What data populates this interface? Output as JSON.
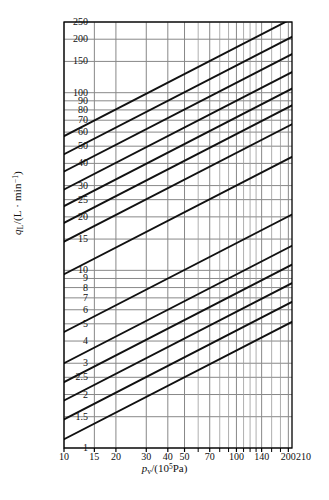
{
  "chart_data": {
    "type": "line",
    "title": "",
    "subtitle": "",
    "xlabel": "p_v/(10^5 Pa)",
    "ylabel": "q_L/(L · min^-1)",
    "xscale": "log",
    "yscale": "log",
    "xlim": [
      10,
      210
    ],
    "ylim": [
      1,
      250
    ],
    "grid": true,
    "legend": false,
    "x_ticks": [
      {
        "value": 10,
        "label": "10"
      },
      {
        "value": 15,
        "label": "15"
      },
      {
        "value": 20,
        "label": "20"
      },
      {
        "value": 30,
        "label": "30"
      },
      {
        "value": 40,
        "label": "40"
      },
      {
        "value": 50,
        "label": "50"
      },
      {
        "value": 70,
        "label": "70"
      },
      {
        "value": 100,
        "label": "100"
      },
      {
        "value": 140,
        "label": "140"
      },
      {
        "value": 200,
        "label": "200"
      }
    ],
    "x_minor_ticks": [
      60,
      80,
      90,
      110,
      120,
      130,
      160,
      180
    ],
    "x_end_label": "210",
    "y_ticks": [
      {
        "value": 1,
        "label": "1"
      },
      {
        "value": 1.5,
        "label": "1.5"
      },
      {
        "value": 2,
        "label": "2"
      },
      {
        "value": 2.5,
        "label": "2.5"
      },
      {
        "value": 3,
        "label": "3"
      },
      {
        "value": 4,
        "label": "4"
      },
      {
        "value": 5,
        "label": "5"
      },
      {
        "value": 6,
        "label": "6"
      },
      {
        "value": 7,
        "label": "7"
      },
      {
        "value": 8,
        "label": "8"
      },
      {
        "value": 9,
        "label": "9"
      },
      {
        "value": 10,
        "label": "10"
      },
      {
        "value": 15,
        "label": "15"
      },
      {
        "value": 20,
        "label": "20"
      },
      {
        "value": 25,
        "label": "25"
      },
      {
        "value": 30,
        "label": "30"
      },
      {
        "value": 40,
        "label": "40"
      },
      {
        "value": 50,
        "label": "50"
      },
      {
        "value": 60,
        "label": "60"
      },
      {
        "value": 70,
        "label": "70"
      },
      {
        "value": 80,
        "label": "80"
      },
      {
        "value": 90,
        "label": "90"
      },
      {
        "value": 100,
        "label": "100"
      },
      {
        "value": 150,
        "label": "150"
      },
      {
        "value": 200,
        "label": "200"
      },
      {
        "value": 250,
        "label": "250"
      }
    ],
    "series_description": "Family of parallel straight lines on log-log axes; each line has slope 0.5 (q_L proportional to sqrt(p_v)). Lines are identified by their flow value at p_v = 10 x 10^5 Pa.",
    "series": [
      {
        "name": "line-1",
        "q_at_x10": 1.12,
        "slope": 0.5
      },
      {
        "name": "line-2",
        "q_at_x10": 1.45,
        "slope": 0.5
      },
      {
        "name": "line-3",
        "q_at_x10": 1.85,
        "slope": 0.5
      },
      {
        "name": "line-4",
        "q_at_x10": 2.35,
        "slope": 0.5
      },
      {
        "name": "line-5",
        "q_at_x10": 3.0,
        "slope": 0.5
      },
      {
        "name": "line-6",
        "q_at_x10": 4.5,
        "slope": 0.5
      },
      {
        "name": "line-7",
        "q_at_x10": 9.5,
        "slope": 0.5
      },
      {
        "name": "line-8",
        "q_at_x10": 14.5,
        "slope": 0.5
      },
      {
        "name": "line-9",
        "q_at_x10": 18.5,
        "slope": 0.5
      },
      {
        "name": "line-10",
        "q_at_x10": 23.0,
        "slope": 0.5
      },
      {
        "name": "line-11",
        "q_at_x10": 28.5,
        "slope": 0.5
      },
      {
        "name": "line-12",
        "q_at_x10": 36.0,
        "slope": 0.5
      },
      {
        "name": "line-13",
        "q_at_x10": 45.0,
        "slope": 0.5
      },
      {
        "name": "line-14",
        "q_at_x10": 57.0,
        "slope": 0.5
      }
    ],
    "colors": {
      "line": "#111111",
      "grid": "#808080",
      "frame": "#000000",
      "background": "#ffffff"
    }
  }
}
